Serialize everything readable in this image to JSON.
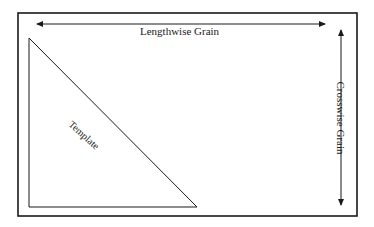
{
  "diagram": {
    "colors": {
      "background": "#ffffff",
      "stroke": "#1a1a1a"
    },
    "frame": {
      "x": 18,
      "y": 13,
      "width": 339,
      "height": 203,
      "stroke_width": 1.6
    },
    "arrows": {
      "lengthwise": {
        "x1": 37,
        "y1": 24,
        "x2": 325,
        "y2": 24,
        "double_headed": true
      },
      "crosswise": {
        "x1": 341,
        "y1": 29,
        "x2": 341,
        "y2": 206,
        "double_headed": true
      }
    },
    "template_triangle": {
      "points": [
        [
          29,
          38
        ],
        [
          29,
          207
        ],
        [
          197,
          207
        ]
      ]
    },
    "labels": {
      "lengthwise": "Lengthwise Grain",
      "crosswise": "Crosswise Grain",
      "template": "Template"
    }
  }
}
